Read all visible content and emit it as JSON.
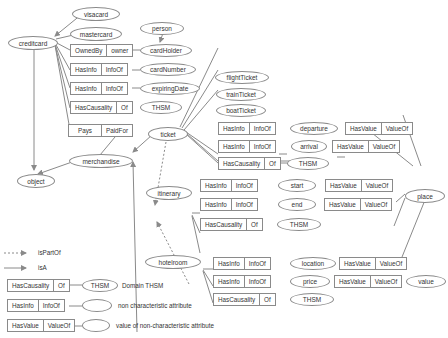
{
  "concepts": {
    "creditcard": "creditcard",
    "visacard": "visacard",
    "mastercard": "mastercard",
    "person": "person",
    "cardHolder": "cardHolder",
    "cardNumber": "cardNumber",
    "expiringDate": "expiringDate",
    "thsm1": "THSM",
    "object": "object",
    "merchandise": "merchandise",
    "ticket": "ticket",
    "flightTicket": "flightTicket",
    "trainTicket": "trainTicket",
    "boatTicket": "boatTicket",
    "departure": "departure",
    "arrival": "arrival",
    "thsm2": "THSM",
    "place": "place",
    "itinerary": "itinerary",
    "start": "start",
    "end": "end",
    "thsm3": "THSM",
    "hotelroom": "hotelroom",
    "location": "location",
    "price": "price",
    "value": "value",
    "thsm4": "THSM"
  },
  "relations": {
    "ownedBy": [
      "OwnedBy",
      "owner"
    ],
    "hasInfo": [
      "HasInfo",
      "InfoOf"
    ],
    "hasCausality": [
      "HasCausality",
      "Of"
    ],
    "hasValue": [
      "HasValue",
      "ValueOf"
    ],
    "pays": [
      "Pays",
      "PaidFor"
    ]
  },
  "legend": {
    "isPartOf": "isPartOf",
    "isA": "isA",
    "domain_thsm_node": "THSM",
    "domain_thsm": "Domain THSM",
    "non_characteristic": "non characteristic attribute",
    "value_non_characteristic": "value of non-characteristic attribute"
  },
  "colors": {
    "line": "#8a8a8a",
    "border": "#8a8a8a",
    "text": "#333333"
  }
}
